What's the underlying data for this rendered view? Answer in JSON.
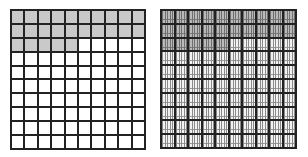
{
  "figure": {
    "colors": {
      "grid_line": "#222222",
      "shaded": "#c9c9c9",
      "unshaded": "#ffffff"
    },
    "left_grid": {
      "rows": 10,
      "cols": 10,
      "subdivisions_per_cell": 1,
      "shaded_cells": 25,
      "shaded_pattern": "rows 1-2 fully shaded, row 3 first 5 cells shaded"
    },
    "right_grid": {
      "rows": 10,
      "cols": 10,
      "subdivisions_per_cell": 10,
      "shaded_cells": 25,
      "shaded_pattern": "rows 1-2 fully shaded, row 3 first 5 cells shaded"
    }
  }
}
